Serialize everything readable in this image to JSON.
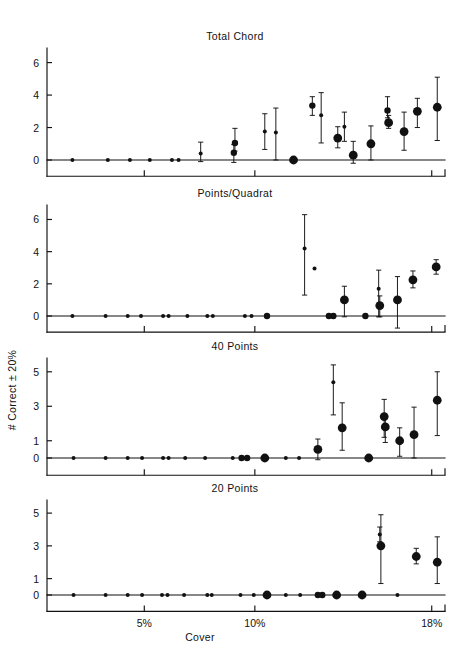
{
  "figure": {
    "ylabel": "# Correct ± 20%",
    "xlabel": "Cover",
    "xticks": [
      {
        "value": 5,
        "label": "5%"
      },
      {
        "value": 10,
        "label": "10%"
      },
      {
        "value": 18,
        "label": "18%"
      }
    ]
  },
  "chart_data": [
    {
      "type": "scatter",
      "title": "Total Chord",
      "xlabel": "Cover",
      "ylabel": "# Correct ± 20%",
      "xlim": [
        0.6,
        18.6
      ],
      "ylim": [
        -1.0,
        6.9
      ],
      "yticks": [
        0,
        2,
        4,
        6
      ],
      "ytick_labels": [
        "0",
        "2",
        "4",
        "6"
      ],
      "grid": false,
      "legend": "none",
      "error_bars": "vertical",
      "points": [
        {
          "x": 1.75,
          "y": 0.0,
          "err_lo": 0.0,
          "err_hi": 0.0,
          "size": "small"
        },
        {
          "x": 3.35,
          "y": 0.0,
          "err_lo": 0.0,
          "err_hi": 0.0,
          "size": "small"
        },
        {
          "x": 4.35,
          "y": 0.0,
          "err_lo": 0.0,
          "err_hi": 0.0,
          "size": "small"
        },
        {
          "x": 5.25,
          "y": 0.0,
          "err_lo": 0.0,
          "err_hi": 0.0,
          "size": "small"
        },
        {
          "x": 6.25,
          "y": 0.0,
          "err_lo": 0.0,
          "err_hi": 0.0,
          "size": "small"
        },
        {
          "x": 6.55,
          "y": 0.0,
          "err_lo": 0.0,
          "err_hi": 0.0,
          "size": "small"
        },
        {
          "x": 7.55,
          "y": 0.4,
          "err_lo": 0.5,
          "err_hi": 0.7,
          "size": "small"
        },
        {
          "x": 9.05,
          "y": 0.45,
          "err_lo": 0.6,
          "err_hi": 0.5,
          "size": "medium"
        },
        {
          "x": 9.1,
          "y": 1.05,
          "err_lo": 0.5,
          "err_hi": 0.9,
          "size": "medium"
        },
        {
          "x": 10.45,
          "y": 1.75,
          "err_lo": 1.1,
          "err_hi": 1.1,
          "size": "small"
        },
        {
          "x": 10.95,
          "y": 1.7,
          "err_lo": 1.7,
          "err_hi": 1.5,
          "size": "small"
        },
        {
          "x": 11.75,
          "y": 0.0,
          "err_lo": 0.0,
          "err_hi": 0.0,
          "size": "large"
        },
        {
          "x": 12.6,
          "y": 3.35,
          "err_lo": 0.6,
          "err_hi": 0.55,
          "size": "medium"
        },
        {
          "x": 13.0,
          "y": 2.75,
          "err_lo": 1.7,
          "err_hi": 1.4,
          "size": "small"
        },
        {
          "x": 13.75,
          "y": 1.35,
          "err_lo": 0.6,
          "err_hi": 0.7,
          "size": "large"
        },
        {
          "x": 14.05,
          "y": 2.05,
          "err_lo": 0.9,
          "err_hi": 0.9,
          "size": "small"
        },
        {
          "x": 14.45,
          "y": 0.3,
          "err_lo": 0.5,
          "err_hi": 0.85,
          "size": "large"
        },
        {
          "x": 15.25,
          "y": 1.0,
          "err_lo": 1.0,
          "err_hi": 1.1,
          "size": "large"
        },
        {
          "x": 16.0,
          "y": 3.05,
          "err_lo": 0.45,
          "err_hi": 0.85,
          "size": "medium"
        },
        {
          "x": 16.05,
          "y": 2.3,
          "err_lo": 0.35,
          "err_hi": 0.45,
          "size": "large"
        },
        {
          "x": 16.75,
          "y": 1.75,
          "err_lo": 1.15,
          "err_hi": 1.2,
          "size": "large"
        },
        {
          "x": 17.35,
          "y": 3.0,
          "err_lo": 1.0,
          "err_hi": 0.8,
          "size": "large"
        },
        {
          "x": 18.25,
          "y": 3.25,
          "err_lo": 2.05,
          "err_hi": 1.85,
          "size": "large"
        }
      ]
    },
    {
      "type": "scatter",
      "title": "Points/Quadrat",
      "xlabel": "Cover",
      "ylabel": "# Correct ± 20%",
      "xlim": [
        0.6,
        18.6
      ],
      "ylim": [
        -1.0,
        6.9
      ],
      "yticks": [
        0,
        2,
        4,
        6
      ],
      "ytick_labels": [
        "0",
        "2",
        "4",
        "6"
      ],
      "grid": false,
      "legend": "none",
      "error_bars": "vertical",
      "points": [
        {
          "x": 1.75,
          "y": 0.0,
          "err_lo": 0.0,
          "err_hi": 0.0,
          "size": "small"
        },
        {
          "x": 3.25,
          "y": 0.0,
          "err_lo": 0.0,
          "err_hi": 0.0,
          "size": "small"
        },
        {
          "x": 4.25,
          "y": 0.0,
          "err_lo": 0.0,
          "err_hi": 0.0,
          "size": "small"
        },
        {
          "x": 4.85,
          "y": 0.0,
          "err_lo": 0.0,
          "err_hi": 0.0,
          "size": "small"
        },
        {
          "x": 5.85,
          "y": 0.0,
          "err_lo": 0.0,
          "err_hi": 0.0,
          "size": "small"
        },
        {
          "x": 6.1,
          "y": 0.0,
          "err_lo": 0.0,
          "err_hi": 0.0,
          "size": "small"
        },
        {
          "x": 6.95,
          "y": 0.0,
          "err_lo": 0.0,
          "err_hi": 0.0,
          "size": "small"
        },
        {
          "x": 7.85,
          "y": 0.0,
          "err_lo": 0.0,
          "err_hi": 0.0,
          "size": "small"
        },
        {
          "x": 8.1,
          "y": 0.0,
          "err_lo": 0.0,
          "err_hi": 0.0,
          "size": "small"
        },
        {
          "x": 9.55,
          "y": 0.0,
          "err_lo": 0.0,
          "err_hi": 0.0,
          "size": "small"
        },
        {
          "x": 9.85,
          "y": 0.0,
          "err_lo": 0.0,
          "err_hi": 0.0,
          "size": "small"
        },
        {
          "x": 10.55,
          "y": 0.0,
          "err_lo": 0.0,
          "err_hi": 0.0,
          "size": "medium"
        },
        {
          "x": 12.25,
          "y": 4.2,
          "err_lo": 2.9,
          "err_hi": 2.1,
          "size": "small"
        },
        {
          "x": 12.7,
          "y": 2.95,
          "err_lo": 0.0,
          "err_hi": 0.0,
          "size": "small"
        },
        {
          "x": 13.35,
          "y": 0.0,
          "err_lo": 0.0,
          "err_hi": 0.0,
          "size": "medium"
        },
        {
          "x": 13.55,
          "y": 0.0,
          "err_lo": 0.0,
          "err_hi": 0.0,
          "size": "medium"
        },
        {
          "x": 14.05,
          "y": 1.0,
          "err_lo": 1.05,
          "err_hi": 0.85,
          "size": "large"
        },
        {
          "x": 15.0,
          "y": 0.0,
          "err_lo": 0.0,
          "err_hi": 0.0,
          "size": "medium"
        },
        {
          "x": 15.6,
          "y": 1.7,
          "err_lo": 1.75,
          "err_hi": 1.15,
          "size": "small"
        },
        {
          "x": 15.65,
          "y": 0.65,
          "err_lo": 0.7,
          "err_hi": 0.6,
          "size": "large"
        },
        {
          "x": 16.45,
          "y": 1.0,
          "err_lo": 1.75,
          "err_hi": 1.45,
          "size": "large"
        },
        {
          "x": 17.15,
          "y": 2.25,
          "err_lo": 0.5,
          "err_hi": 0.55,
          "size": "large"
        },
        {
          "x": 18.2,
          "y": 3.05,
          "err_lo": 0.45,
          "err_hi": 0.45,
          "size": "large"
        }
      ]
    },
    {
      "type": "scatter",
      "title": "40 Points",
      "xlabel": "Cover",
      "ylabel": "# Correct ± 20%",
      "xlim": [
        0.6,
        18.6
      ],
      "ylim": [
        -1.0,
        5.8
      ],
      "yticks": [
        0,
        1,
        3,
        5
      ],
      "ytick_labels": [
        "0",
        "1",
        "3",
        "5"
      ],
      "grid": false,
      "legend": "none",
      "error_bars": "vertical",
      "points": [
        {
          "x": 1.8,
          "y": 0.0,
          "err_lo": 0.0,
          "err_hi": 0.0,
          "size": "small"
        },
        {
          "x": 3.25,
          "y": 0.0,
          "err_lo": 0.0,
          "err_hi": 0.0,
          "size": "small"
        },
        {
          "x": 4.25,
          "y": 0.0,
          "err_lo": 0.0,
          "err_hi": 0.0,
          "size": "small"
        },
        {
          "x": 4.9,
          "y": 0.0,
          "err_lo": 0.0,
          "err_hi": 0.0,
          "size": "small"
        },
        {
          "x": 5.85,
          "y": 0.0,
          "err_lo": 0.0,
          "err_hi": 0.0,
          "size": "small"
        },
        {
          "x": 6.1,
          "y": 0.0,
          "err_lo": 0.0,
          "err_hi": 0.0,
          "size": "small"
        },
        {
          "x": 6.85,
          "y": 0.0,
          "err_lo": 0.0,
          "err_hi": 0.0,
          "size": "small"
        },
        {
          "x": 7.75,
          "y": 0.0,
          "err_lo": 0.0,
          "err_hi": 0.0,
          "size": "small"
        },
        {
          "x": 9.0,
          "y": 0.0,
          "err_lo": 0.0,
          "err_hi": 0.0,
          "size": "small"
        },
        {
          "x": 9.4,
          "y": 0.0,
          "err_lo": 0.0,
          "err_hi": 0.0,
          "size": "medium"
        },
        {
          "x": 9.65,
          "y": 0.0,
          "err_lo": 0.0,
          "err_hi": 0.0,
          "size": "medium"
        },
        {
          "x": 10.45,
          "y": 0.0,
          "err_lo": 0.0,
          "err_hi": 0.0,
          "size": "large"
        },
        {
          "x": 11.4,
          "y": 0.0,
          "err_lo": 0.0,
          "err_hi": 0.0,
          "size": "small"
        },
        {
          "x": 12.0,
          "y": 0.0,
          "err_lo": 0.0,
          "err_hi": 0.0,
          "size": "small"
        },
        {
          "x": 12.85,
          "y": 0.5,
          "err_lo": 0.6,
          "err_hi": 0.6,
          "size": "large"
        },
        {
          "x": 13.55,
          "y": 4.4,
          "err_lo": 1.9,
          "err_hi": 1.0,
          "size": "small"
        },
        {
          "x": 13.95,
          "y": 1.75,
          "err_lo": 1.3,
          "err_hi": 1.45,
          "size": "large"
        },
        {
          "x": 15.15,
          "y": 0.0,
          "err_lo": 0.0,
          "err_hi": 0.0,
          "size": "large"
        },
        {
          "x": 15.85,
          "y": 2.4,
          "err_lo": 1.2,
          "err_hi": 1.0,
          "size": "large"
        },
        {
          "x": 15.9,
          "y": 1.8,
          "err_lo": 0.9,
          "err_hi": 0.65,
          "size": "large"
        },
        {
          "x": 16.55,
          "y": 1.0,
          "err_lo": 0.9,
          "err_hi": 0.75,
          "size": "large"
        },
        {
          "x": 17.2,
          "y": 1.35,
          "err_lo": 1.35,
          "err_hi": 1.6,
          "size": "large"
        },
        {
          "x": 18.25,
          "y": 3.35,
          "err_lo": 2.05,
          "err_hi": 1.65,
          "size": "large"
        }
      ]
    },
    {
      "type": "scatter",
      "title": "20 Points",
      "xlabel": "Cover",
      "ylabel": "# Correct ± 20%",
      "xlim": [
        0.6,
        18.6
      ],
      "ylim": [
        -1.0,
        5.8
      ],
      "yticks": [
        0,
        1,
        3,
        5
      ],
      "ytick_labels": [
        "0",
        "1",
        "3",
        "5"
      ],
      "grid": false,
      "legend": "none",
      "error_bars": "vertical",
      "points": [
        {
          "x": 1.8,
          "y": 0.0,
          "err_lo": 0.0,
          "err_hi": 0.0,
          "size": "small"
        },
        {
          "x": 3.25,
          "y": 0.0,
          "err_lo": 0.0,
          "err_hi": 0.0,
          "size": "small"
        },
        {
          "x": 4.25,
          "y": 0.0,
          "err_lo": 0.0,
          "err_hi": 0.0,
          "size": "small"
        },
        {
          "x": 4.9,
          "y": 0.0,
          "err_lo": 0.0,
          "err_hi": 0.0,
          "size": "small"
        },
        {
          "x": 5.8,
          "y": 0.0,
          "err_lo": 0.0,
          "err_hi": 0.0,
          "size": "small"
        },
        {
          "x": 6.05,
          "y": 0.0,
          "err_lo": 0.0,
          "err_hi": 0.0,
          "size": "small"
        },
        {
          "x": 6.8,
          "y": 0.0,
          "err_lo": 0.0,
          "err_hi": 0.0,
          "size": "small"
        },
        {
          "x": 7.85,
          "y": 0.0,
          "err_lo": 0.0,
          "err_hi": 0.0,
          "size": "small"
        },
        {
          "x": 8.05,
          "y": 0.0,
          "err_lo": 0.0,
          "err_hi": 0.0,
          "size": "small"
        },
        {
          "x": 9.35,
          "y": 0.0,
          "err_lo": 0.0,
          "err_hi": 0.0,
          "size": "small"
        },
        {
          "x": 9.95,
          "y": 0.0,
          "err_lo": 0.0,
          "err_hi": 0.0,
          "size": "small"
        },
        {
          "x": 10.55,
          "y": 0.0,
          "err_lo": 0.0,
          "err_hi": 0.0,
          "size": "large"
        },
        {
          "x": 11.4,
          "y": 0.0,
          "err_lo": 0.0,
          "err_hi": 0.0,
          "size": "small"
        },
        {
          "x": 12.05,
          "y": 0.0,
          "err_lo": 0.0,
          "err_hi": 0.0,
          "size": "small"
        },
        {
          "x": 12.85,
          "y": 0.0,
          "err_lo": 0.0,
          "err_hi": 0.0,
          "size": "medium"
        },
        {
          "x": 13.05,
          "y": 0.0,
          "err_lo": 0.0,
          "err_hi": 0.0,
          "size": "medium"
        },
        {
          "x": 13.7,
          "y": 0.0,
          "err_lo": 0.0,
          "err_hi": 0.0,
          "size": "large"
        },
        {
          "x": 14.85,
          "y": 0.0,
          "err_lo": 0.0,
          "err_hi": 0.0,
          "size": "large"
        },
        {
          "x": 15.65,
          "y": 3.7,
          "err_lo": 0.45,
          "err_hi": 0.45,
          "size": "small"
        },
        {
          "x": 15.7,
          "y": 3.0,
          "err_lo": 2.3,
          "err_hi": 1.9,
          "size": "large"
        },
        {
          "x": 16.45,
          "y": 0.0,
          "err_lo": 0.0,
          "err_hi": 0.0,
          "size": "small"
        },
        {
          "x": 17.3,
          "y": 2.35,
          "err_lo": 0.45,
          "err_hi": 0.5,
          "size": "large"
        },
        {
          "x": 18.25,
          "y": 2.0,
          "err_lo": 1.3,
          "err_hi": 1.55,
          "size": "large"
        }
      ]
    }
  ]
}
